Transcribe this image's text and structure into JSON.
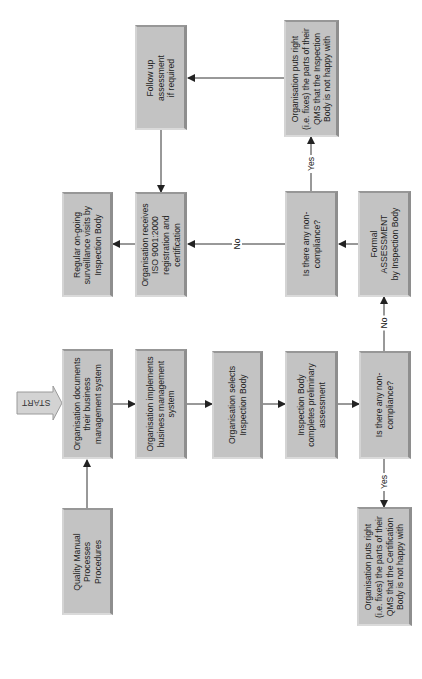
{
  "diagram": {
    "title": "",
    "start_label": "START",
    "boxes": {
      "follow_up": "Follow up\nassessment\nif required",
      "org_puts_right_inspection": "Organisation puts right\n(i.e. fixes) the parts of their\nQMS that the Inspection\nBody is not happy with",
      "regular_surveillance": "Regular on-going\nsurveillance visits by\nInspection Body",
      "org_receives_iso": "Organisation receives\nISO 9001:2000\nregistration and\ncertification",
      "noncompliance_after_assessment": "Is there any non-\ncompliance?",
      "formal_assessment": "Formal\nASSESSMENT\nby Inspection Body",
      "org_documents": "Organisation documents\ntheir business\nmanagement system",
      "org_implements": "Organisation implements\nbusiness management\nsystem",
      "org_selects": "Organisation selects\nInspection Body",
      "inspection_preliminary": "Inspection Body\ncompletes preliminary\nassessment",
      "noncompliance_preliminary": "Is there any non-\ncompliance?",
      "quality_manual": "Quality Manual\nProcesses\nProcedures",
      "org_puts_right_certification": "Organisation puts right\n(i.e. fixes) the parts of their\nQMS that the Certification\nBody is not happy with"
    },
    "edge_labels": {
      "yes_after_assessment": "Yes",
      "no_after_assessment": "No",
      "yes_preliminary": "Yes",
      "no_preliminary": "No"
    }
  },
  "colors": {
    "box_fill": "#c3c3c3",
    "box_shadow": "#8e8e8e",
    "line": "#333333",
    "background": "#ffffff"
  }
}
